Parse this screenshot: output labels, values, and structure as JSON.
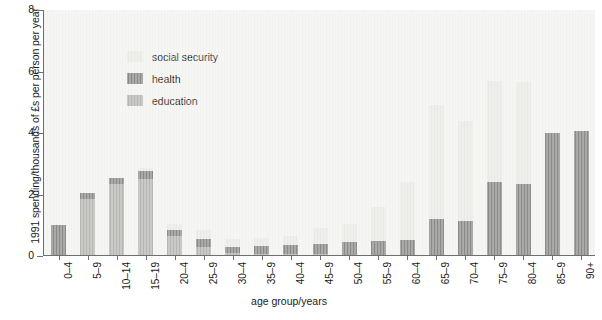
{
  "chart_data": {
    "type": "bar",
    "stacked": true,
    "title": "",
    "xlabel": "age group/years",
    "ylabel": "1991 spending/thousands of £s per person per year",
    "ylim": [
      0,
      8
    ],
    "yticks": [
      0,
      2,
      4,
      6,
      8
    ],
    "grid": false,
    "legend_position": "upper-left-inside",
    "categories": [
      "0–4",
      "5–9",
      "10–14",
      "15–19",
      "20–4",
      "25–9",
      "30–4",
      "35–9",
      "40–4",
      "45–9",
      "50–4",
      "55–9",
      "60–4",
      "65–9",
      "70–4",
      "75–9",
      "80–4",
      "85–9",
      "90+"
    ],
    "series": [
      {
        "name": "education",
        "color": "#b6b6b3",
        "values": [
          0.0,
          1.85,
          2.35,
          2.5,
          0.65,
          0.3,
          0.1,
          0.08,
          0.06,
          0.05,
          0.04,
          0.03,
          0.02,
          0.0,
          0.0,
          0.0,
          0.0,
          0.0,
          0.0
        ]
      },
      {
        "name": "health",
        "color": "#8b8b89",
        "values": [
          1.0,
          0.2,
          0.2,
          0.25,
          0.2,
          0.25,
          0.2,
          0.25,
          0.3,
          0.35,
          0.4,
          0.45,
          0.5,
          1.2,
          1.15,
          2.4,
          2.35,
          4.0,
          4.05
        ]
      },
      {
        "name": "social security",
        "color": "#e9e9e6",
        "values": [
          0.0,
          0.0,
          0.0,
          0.1,
          0.2,
          0.3,
          0.25,
          0.25,
          0.3,
          0.5,
          0.6,
          1.1,
          1.9,
          3.7,
          3.25,
          3.3,
          3.3,
          0.0,
          0.0
        ]
      }
    ],
    "totals": [
      1.0,
      2.05,
      2.55,
      2.85,
      1.05,
      0.85,
      0.55,
      0.58,
      0.66,
      0.9,
      1.04,
      1.58,
      2.42,
      4.9,
      4.4,
      5.7,
      5.65,
      4.0,
      4.05
    ]
  },
  "legend": {
    "items": [
      {
        "label": "social security",
        "color": "#e9e9e6",
        "swatch_name": "legend-swatch-social-security"
      },
      {
        "label": "health",
        "color": "#8b8b89",
        "swatch_name": "legend-swatch-health"
      },
      {
        "label": "education",
        "color": "#b6b6b3",
        "swatch_name": "legend-swatch-education"
      }
    ]
  },
  "credit": ""
}
